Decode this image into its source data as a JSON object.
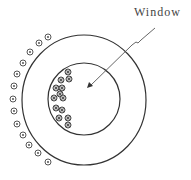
{
  "diagram": {
    "label": "Window",
    "stroke_color": "#333333",
    "outer_circle": {
      "cx": 84,
      "cy": 100,
      "rx": 62,
      "ry": 65
    },
    "inner_circle": {
      "cx": 84,
      "cy": 99,
      "r": 36
    },
    "outer_conductors": {
      "symbol": "dot-in-circle",
      "count": 13,
      "positions": [
        [
          48,
          37
        ],
        [
          39,
          43
        ],
        [
          30,
          52
        ],
        [
          23,
          63
        ],
        [
          17,
          74
        ],
        [
          14,
          86
        ],
        [
          13,
          99
        ],
        [
          14,
          111
        ],
        [
          17,
          124
        ],
        [
          23,
          135
        ],
        [
          29,
          145
        ],
        [
          38,
          153
        ],
        [
          48,
          162
        ]
      ]
    },
    "inner_conductors": {
      "symbol": "cross-in-circle",
      "count": 13,
      "positions": [
        [
          68,
          72
        ],
        [
          69,
          79
        ],
        [
          61,
          80
        ],
        [
          56,
          88
        ],
        [
          62,
          88
        ],
        [
          54,
          98
        ],
        [
          60,
          94
        ],
        [
          63,
          98
        ],
        [
          56,
          108
        ],
        [
          62,
          110
        ],
        [
          59,
          118
        ],
        [
          68,
          118
        ],
        [
          68,
          125
        ]
      ]
    },
    "leader_line": {
      "points": [
        [
          155,
          28
        ],
        [
          141,
          40
        ],
        [
          138,
          43
        ],
        [
          136,
          42
        ],
        [
          132,
          45
        ],
        [
          90,
          86
        ]
      ],
      "arrow_tip": [
        87,
        88
      ]
    }
  }
}
